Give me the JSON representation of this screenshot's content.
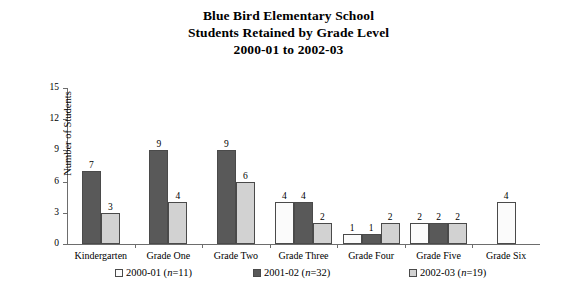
{
  "title": {
    "line1": "Blue Bird Elementary School",
    "line2": "Students Retained by Grade Level",
    "line3": "2000-01 to 2002-03"
  },
  "axes": {
    "ylabel": "Number of Students",
    "yticks": [
      "0",
      "3",
      "6",
      "9",
      "12",
      "15"
    ]
  },
  "legend": [
    {
      "label": "2000-01",
      "n_prefix": "(",
      "n_italic": "n",
      "n_suffix": "=11)",
      "swatch": "s0"
    },
    {
      "label": "2001-02",
      "n_prefix": "(",
      "n_italic": "n",
      "n_suffix": "=32)",
      "swatch": "s1"
    },
    {
      "label": "2002-03",
      "n_prefix": "(",
      "n_italic": "n",
      "n_suffix": "=19)",
      "swatch": "s2"
    }
  ],
  "chart_data": {
    "type": "bar",
    "title": "Blue Bird Elementary School Students Retained by Grade Level 2000-01 to 2002-03",
    "xlabel": "",
    "ylabel": "Number of Students",
    "ylim": [
      0,
      15
    ],
    "yticks": [
      0,
      3,
      6,
      9,
      12,
      15
    ],
    "grid": false,
    "legend_position": "bottom",
    "categories": [
      "Kindergarten",
      "Grade One",
      "Grade Two",
      "Grade Three",
      "Grade Four",
      "Grade Five",
      "Grade Six"
    ],
    "series": [
      {
        "name": "2000-01 (n=11)",
        "color": "#fbfbfb",
        "values": [
          0,
          0,
          0,
          4,
          1,
          2,
          4
        ]
      },
      {
        "name": "2001-02 (n=32)",
        "color": "#595959",
        "values": [
          7,
          9,
          9,
          4,
          1,
          2,
          0
        ]
      },
      {
        "name": "2002-03 (n=19)",
        "color": "#d2d2d2",
        "values": [
          3,
          4,
          6,
          2,
          2,
          2,
          0
        ]
      }
    ]
  }
}
